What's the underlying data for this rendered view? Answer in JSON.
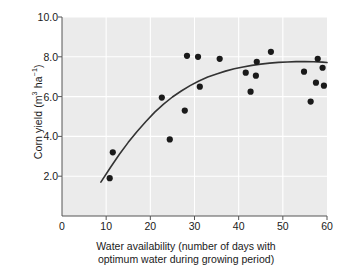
{
  "chart_data": {
    "type": "scatter",
    "title": "",
    "xlabel": "Water availability (number of days with optimum water during growing period)",
    "xlabel_line1": "Water availability (number of days with",
    "xlabel_line2": "optimum water during growing period)",
    "ylabel": "Corn yield (m³ ha⁻¹)",
    "ylabel_prefix": "Corn yield (m",
    "ylabel_sup1": "3",
    "ylabel_mid": " ha",
    "ylabel_sup2": "−1",
    "ylabel_suffix": ")",
    "xlim": [
      0,
      60
    ],
    "ylim": [
      0,
      10
    ],
    "xticks": [
      0,
      10,
      20,
      30,
      40,
      50,
      60
    ],
    "xtick_labels": [
      "0",
      "10",
      "20",
      "30",
      "40",
      "50",
      "60"
    ],
    "yticks": [
      2.0,
      4.0,
      6.0,
      8.0,
      10.0
    ],
    "ytick_labels": [
      "2.0",
      "4.0",
      "6.0",
      "8.0",
      "10.0"
    ],
    "grid": true,
    "grid_color": "#ffffff",
    "plot_background": "#ebebeb",
    "marker_color": "#1a1a1a",
    "marker_size": 3.1,
    "curve_color": "#333333",
    "legend": null,
    "series": [
      {
        "name": "Corn yield observations",
        "marker": "filled-circle",
        "points": [
          [
            10.8,
            1.9
          ],
          [
            11.5,
            3.2
          ],
          [
            22.6,
            5.95
          ],
          [
            24.4,
            3.85
          ],
          [
            27.8,
            5.3
          ],
          [
            28.3,
            8.05
          ],
          [
            30.8,
            8.0
          ],
          [
            31.2,
            6.5
          ],
          [
            35.7,
            7.9
          ],
          [
            41.6,
            7.2
          ],
          [
            42.7,
            6.25
          ],
          [
            43.9,
            7.05
          ],
          [
            44.1,
            7.75
          ],
          [
            47.3,
            8.25
          ],
          [
            54.8,
            7.25
          ],
          [
            56.3,
            5.75
          ],
          [
            57.5,
            6.7
          ],
          [
            57.9,
            7.9
          ],
          [
            59.0,
            7.45
          ],
          [
            59.3,
            6.55
          ]
        ]
      }
    ],
    "fit_curve": {
      "name": "saturating trend line",
      "x_start": 8.8,
      "x_end": 60.0,
      "points": [
        [
          8.8,
          1.7
        ],
        [
          11.0,
          2.45
        ],
        [
          13.0,
          3.1
        ],
        [
          15.0,
          3.7
        ],
        [
          17.0,
          4.25
        ],
        [
          19.0,
          4.75
        ],
        [
          21.0,
          5.22
        ],
        [
          23.0,
          5.62
        ],
        [
          25.0,
          5.98
        ],
        [
          27.0,
          6.28
        ],
        [
          29.0,
          6.55
        ],
        [
          31.0,
          6.78
        ],
        [
          33.0,
          6.98
        ],
        [
          35.0,
          7.14
        ],
        [
          37.0,
          7.28
        ],
        [
          39.0,
          7.4
        ],
        [
          41.0,
          7.49
        ],
        [
          43.0,
          7.57
        ],
        [
          45.0,
          7.63
        ],
        [
          47.0,
          7.68
        ],
        [
          49.0,
          7.72
        ],
        [
          51.0,
          7.74
        ],
        [
          53.0,
          7.76
        ],
        [
          55.0,
          7.76
        ],
        [
          57.0,
          7.75
        ],
        [
          59.0,
          7.73
        ],
        [
          60.0,
          7.71
        ]
      ]
    }
  }
}
